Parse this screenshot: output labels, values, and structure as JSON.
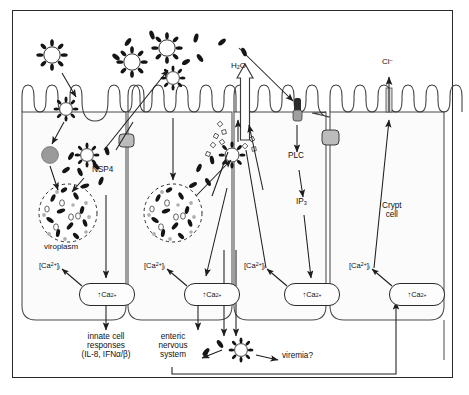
{
  "diagram": {
    "type": "biological-pathway-schematic",
    "frame": {
      "border_color": "#2a2a2a",
      "background": "#ffffff"
    },
    "palette": {
      "line": "#2b2b2b",
      "particle_dark": "#161616",
      "junction_gray": "#b9b9b9",
      "cell_fill": "#fbfbfb",
      "endosome_gray": "#9a9a9a",
      "text": "#111111"
    }
  },
  "labels": {
    "water": "H",
    "water_sub": "2",
    "water_tail": "O",
    "chloride": "Cl",
    "chloride_sup": "–",
    "nsp4": "NSP4",
    "viroplasm": "viroplasm",
    "plc": "PLC",
    "ip3": "IP",
    "ip3_sub": "3",
    "crypt_cell_line1": "Crypt",
    "crypt_cell_line2": "cell",
    "viremia": "viremia?",
    "enteric_line1": "enteric",
    "enteric_line2": "nervous",
    "enteric_line3": "system",
    "innate_line1": "innate cell",
    "innate_line2": "responses",
    "innate_line3": "(IL-8, IFNα/β)"
  },
  "calcium": {
    "pool_label_prefix": "[Ca",
    "pool_label_sup": "2+",
    "pool_label_suffix": "]",
    "pool_label_sub": "i",
    "box_arrow": "↑",
    "box_text": "Ca",
    "box_sup": "2+"
  },
  "cells": [
    {
      "id": "cell-1",
      "name": "enterocyte-infected-left",
      "calcium_pool": "[Ca2+]i",
      "calcium_box": "↑Ca2+",
      "features": [
        "viroplasm",
        "NSP4",
        "endosome",
        "entering-virion"
      ],
      "output": "innate cell responses (IL-8, IFNα/β)"
    },
    {
      "id": "cell-2",
      "name": "enterocyte-infected-middle",
      "calcium_pool": "[Ca2+]i",
      "calcium_box": "↑Ca2+",
      "features": [
        "viroplasm",
        "NSP4",
        "released-virions"
      ],
      "output": "enteric nervous system"
    },
    {
      "id": "cell-3",
      "name": "enterocyte-nsp4-receptor",
      "calcium_pool": "[Ca2+]i",
      "calcium_box": "↑Ca2+",
      "features": [
        "NSP4-receptor",
        "PLC",
        "IP3"
      ],
      "output": "IP3 signalling"
    },
    {
      "id": "cell-4",
      "name": "crypt-cell",
      "calcium_pool": "[Ca2+]i",
      "calcium_box": "↑Ca2+",
      "features": [
        "chloride-secretion",
        "tight-junction"
      ],
      "output": "Cl– secretion"
    }
  ],
  "elements": {
    "virion": "rotavirus-particle",
    "nsp4_rod": "nsp4-rod",
    "tight_junction": "tight-junction",
    "receptor": "nsp4-receptor",
    "endosome": "endosome",
    "water_arrow": "water-efflux-arrow",
    "chloride_channel": "chloride-channel"
  }
}
